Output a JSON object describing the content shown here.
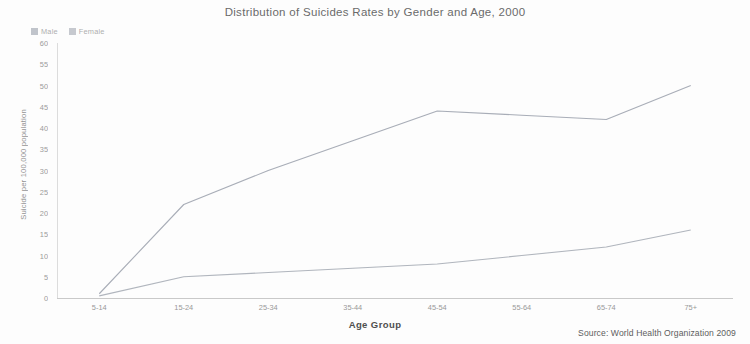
{
  "title": "Distribution of Suicides Rates by Gender and Age, 2000",
  "xlabel": "Age Group",
  "ylabel": "Suicide per 100,000 population",
  "source": "Source: World Health Organization 2009",
  "legend": [
    {
      "label": "Male",
      "color": "#8f96a3"
    },
    {
      "label": "Female",
      "color": "#9aa0ab"
    }
  ],
  "chart_data": {
    "type": "line",
    "title": "Distribution of Suicides Rates by Gender and Age, 2000",
    "xlabel": "Age Group",
    "ylabel": "Suicide per 100,000 population",
    "categories": [
      "5-14",
      "15-24",
      "25-34",
      "35-44",
      "45-54",
      "55-64",
      "65-74",
      "75+"
    ],
    "series": [
      {
        "name": "Male",
        "color": "#8f96a3",
        "values": [
          1,
          22,
          30,
          37,
          44,
          43,
          42,
          50
        ]
      },
      {
        "name": "Female",
        "color": "#9aa0ab",
        "values": [
          0.5,
          5,
          6,
          7,
          8,
          10,
          12,
          16
        ]
      }
    ],
    "ylim": [
      0,
      60
    ],
    "ytick_step": 5,
    "yticks": [
      0,
      5,
      10,
      15,
      20,
      25,
      30,
      35,
      40,
      45,
      50,
      55,
      60
    ],
    "grid": false,
    "legend_position": "top-left",
    "annotations": [
      "Source: World Health Organization 2009"
    ]
  }
}
